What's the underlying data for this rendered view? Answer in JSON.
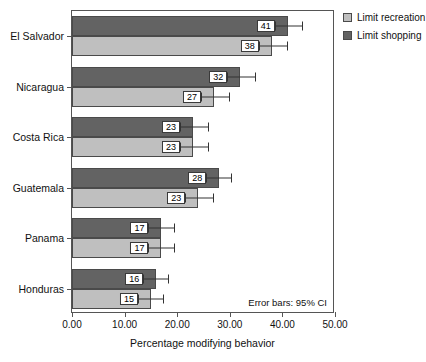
{
  "chart_data": {
    "type": "bar",
    "orientation": "horizontal",
    "title": "",
    "xlabel": "Percentage modifying behavior",
    "ylabel": "",
    "xlim": [
      0,
      50
    ],
    "xticks": [
      "0.00",
      "10.00",
      "20.00",
      "30.00",
      "40.00",
      "50.00"
    ],
    "grid": false,
    "legend_position": "top-right",
    "annotation": "Error bars: 95% CI",
    "categories": [
      "El Salvador",
      "Nicaragua",
      "Costa Rica",
      "Guatemala",
      "Panama",
      "Honduras"
    ],
    "series": [
      {
        "name": "Limit shopping",
        "color": "#636363",
        "values": [
          41,
          32,
          23,
          28,
          17,
          16
        ],
        "labels": [
          "41",
          "32",
          "23",
          "28",
          "17",
          "16"
        ],
        "ci_low": [
          38.5,
          29.5,
          20.5,
          25.5,
          14.5,
          13.5
        ],
        "ci_high": [
          44.0,
          35.0,
          26.0,
          30.5,
          19.5,
          18.5
        ]
      },
      {
        "name": "Limit recreation",
        "color": "#bfbfbf",
        "values": [
          38,
          27,
          23,
          24,
          17,
          15
        ],
        "labels": [
          "38",
          "27",
          "23",
          "23",
          "17",
          "15"
        ],
        "ci_low": [
          35.5,
          24.5,
          20.5,
          21.5,
          14.5,
          12.5
        ],
        "ci_high": [
          41.0,
          30.0,
          26.0,
          27.0,
          19.5,
          17.5
        ]
      }
    ]
  },
  "legend": {
    "items": [
      {
        "label": "Limit recreation",
        "swatch": "recreation"
      },
      {
        "label": "Limit shopping",
        "swatch": "shopping"
      }
    ]
  },
  "axis": {
    "x_title": "Percentage modifying behavior"
  },
  "note": {
    "error_bars": "Error bars: 95% CI"
  }
}
